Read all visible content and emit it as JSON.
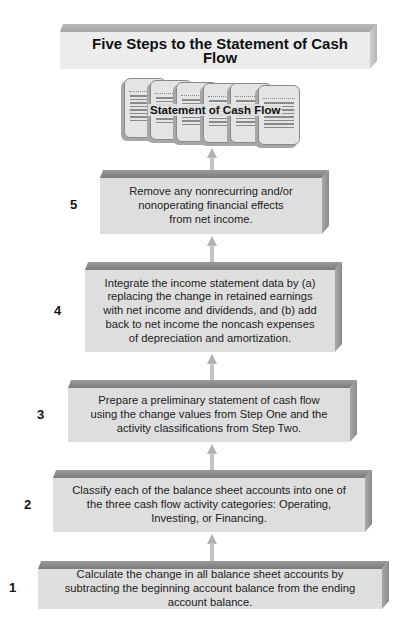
{
  "title": "Five Steps to the Statement of Cash Flow",
  "output": {
    "label": "Statement of Cash Flow",
    "icon": "document-stack-icon",
    "document_count": 6
  },
  "steps": [
    {
      "number": "5",
      "text": "Remove any nonrecurring and/or nonoperating financial effects from net income."
    },
    {
      "number": "4",
      "text": "Integrate the income statement data by (a) replacing the change in retained earnings with net income and dividends, and (b) add back to net income the noncash expenses of depreciation and amortization."
    },
    {
      "number": "3",
      "text": "Prepare a preliminary statement of cash flow using the change values from Step One and the activity classifications from Step Two."
    },
    {
      "number": "2",
      "text": "Classify each of the balance sheet accounts into one of the three cash flow activity categories: Operating, Investing, or Financing."
    },
    {
      "number": "1",
      "text": "Calculate the change in all balance sheet accounts by subtracting the beginning account balance from the ending account balance."
    }
  ],
  "colors": {
    "box_front": "#dedede",
    "box_top": "#8a8a8a",
    "box_side": "#9a9a9a",
    "arrow": "#b8b8b8",
    "text": "#222222"
  }
}
